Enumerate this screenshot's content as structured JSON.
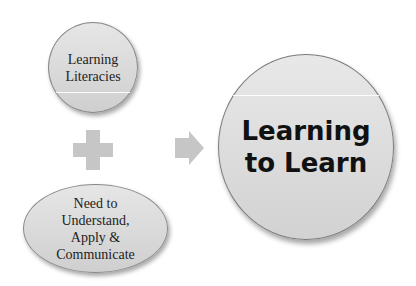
{
  "diagram": {
    "nodes": [
      {
        "id": "learning-literacies",
        "shape": "circle",
        "label": "Learning\nLiteracies"
      },
      {
        "id": "need-to-understand",
        "shape": "ellipse",
        "label": "Need to\nUnderstand,\nApply &\nCommunicate"
      },
      {
        "id": "learning-to-learn",
        "shape": "circle",
        "label": "Learning\nto Learn"
      }
    ],
    "operators": [
      {
        "type": "plus",
        "icon": "plus-icon"
      },
      {
        "type": "arrow",
        "icon": "arrow-right-icon"
      }
    ],
    "colors": {
      "shape_fill": "#d9d9d9",
      "shape_border": "#8a8a8a",
      "operator_fill": "#c6c6c6",
      "background": "#ffffff"
    }
  }
}
